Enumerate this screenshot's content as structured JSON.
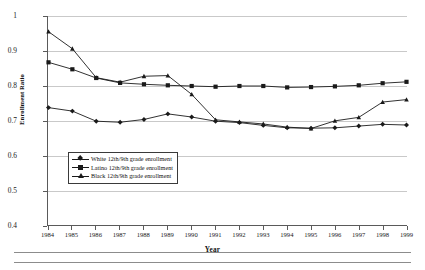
{
  "chart_data": {
    "type": "line",
    "title": "",
    "xlabel": "Year",
    "ylabel": "Enrollment Ratio",
    "x": [
      1984,
      1985,
      1986,
      1987,
      1988,
      1989,
      1990,
      1991,
      1992,
      1993,
      1994,
      1995,
      1996,
      1997,
      1998,
      1999
    ],
    "xtick_labels": [
      "1984",
      "1985",
      "1986",
      "1987",
      "1988",
      "1989",
      "1990",
      "1991",
      "1992",
      "1993",
      "1994",
      "1995",
      "1996",
      "1997",
      "1998",
      "1999"
    ],
    "ytick_labels": [
      "1",
      "0.9",
      "0.8",
      "0.7",
      "0.6",
      "0.5",
      "0.4"
    ],
    "ytick_values": [
      1,
      0.9,
      0.8,
      0.7,
      0.6,
      0.5,
      0.4
    ],
    "ylim": [
      0.4,
      1.0
    ],
    "xlim": [
      1984,
      1999
    ],
    "grid": true,
    "grid_axis": "y",
    "legend_position": "inside-lower-left",
    "series": [
      {
        "name": "White 12th/9th grade enrollment",
        "marker": "diamond",
        "color": "#1a1a1a",
        "values": [
          0.737,
          0.727,
          0.698,
          0.695,
          0.703,
          0.719,
          0.71,
          0.698,
          0.694,
          0.686,
          0.679,
          0.678,
          0.679,
          0.684,
          0.689,
          0.687
        ]
      },
      {
        "name": "Latino 12th/9th grade enrollment",
        "marker": "square",
        "color": "#1a1a1a",
        "values": [
          0.867,
          0.847,
          0.822,
          0.808,
          0.804,
          0.801,
          0.799,
          0.797,
          0.799,
          0.799,
          0.795,
          0.796,
          0.798,
          0.801,
          0.807,
          0.811
        ]
      },
      {
        "name": "Black 12th/9th grade enrollment",
        "marker": "triangle",
        "color": "#1a1a1a",
        "values": [
          0.955,
          0.906,
          0.823,
          0.81,
          0.827,
          0.829,
          0.775,
          0.702,
          0.696,
          0.69,
          0.681,
          0.677,
          0.699,
          0.709,
          0.753,
          0.76
        ]
      }
    ]
  },
  "axes": {
    "x_title": "Year",
    "y_title": "Enrollment Ratio"
  }
}
